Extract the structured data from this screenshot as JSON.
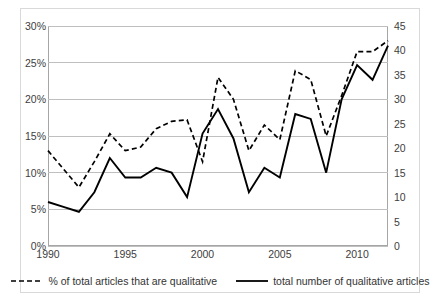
{
  "chart_data": {
    "type": "line",
    "title": "",
    "subtitle": "",
    "xlabel": "",
    "ylabel": "",
    "y2label": "",
    "x": [
      1990,
      1991,
      1992,
      1993,
      1994,
      1995,
      1996,
      1997,
      1998,
      1999,
      2000,
      2001,
      2002,
      2003,
      2004,
      2005,
      2006,
      2007,
      2008,
      2009,
      2010,
      2011,
      2012
    ],
    "xtick_labels": [
      "1990",
      "1995",
      "2000",
      "2005",
      "2010"
    ],
    "xtick_values": [
      1990,
      1995,
      2000,
      2005,
      2010
    ],
    "xlim": [
      1990,
      2012
    ],
    "ylim": [
      0,
      30
    ],
    "ytick_labels": [
      "0%",
      "5%",
      "10%",
      "15%",
      "20%",
      "25%",
      "30%"
    ],
    "ytick_values": [
      0,
      5,
      10,
      15,
      20,
      25,
      30
    ],
    "y2lim": [
      0,
      45
    ],
    "y2tick_labels": [
      "0",
      "5",
      "10",
      "15",
      "20",
      "25",
      "30",
      "35",
      "40",
      "45"
    ],
    "y2tick_values": [
      0,
      5,
      10,
      15,
      20,
      25,
      30,
      35,
      40,
      45
    ],
    "grid": true,
    "grid_axis": "y",
    "legend_position": "bottom",
    "series": [
      {
        "name": "% of total articles that are qualitative",
        "axis": "left",
        "style": "dashed",
        "color": "#000000",
        "unit": "%",
        "values": [
          13.0,
          10.5,
          8.0,
          11.5,
          15.3,
          13.0,
          13.5,
          16.0,
          17.0,
          17.2,
          11.5,
          23.0,
          20.0,
          13.0,
          16.5,
          14.5,
          23.9,
          22.7,
          15.0,
          20.5,
          26.5,
          26.5,
          28.0
        ]
      },
      {
        "name": "total number of qualitative articles",
        "axis": "right",
        "style": "solid",
        "color": "#000000",
        "unit": "articles",
        "values": [
          9,
          8,
          7,
          11,
          18,
          14,
          14,
          16,
          15,
          10,
          23,
          28,
          22,
          11,
          16,
          14,
          27,
          26,
          15,
          30,
          37,
          34,
          41
        ]
      }
    ]
  },
  "legend": {
    "items": [
      {
        "label": "% of total articles that are qualitative",
        "style": "dashed"
      },
      {
        "label": "total number of qualitative articles",
        "style": "solid"
      }
    ]
  },
  "colors": {
    "line": "#000000",
    "grid": "#bfbfbf",
    "axis": "#a6a6a6",
    "frame": "#d9d9d9",
    "tick_text": "#404040",
    "legend_text": "#333333",
    "background": "#ffffff"
  }
}
